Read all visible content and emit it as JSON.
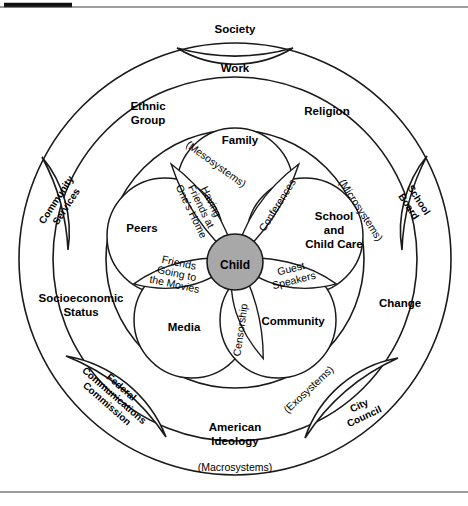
{
  "figure": {
    "center": {
      "label": "Child"
    },
    "levels": {
      "macro_label": "(Macrosystems)",
      "exo_label": "(Exosystems)",
      "meso_label": "(Mesosystems)",
      "micro_label": "(Microsystems)"
    },
    "macrosystem_labels": [
      {
        "id": "society",
        "text": "Society"
      },
      {
        "id": "ethnic-group",
        "text": "Ethnic Group",
        "line1": "Ethnic",
        "line2": "Group"
      },
      {
        "id": "religion",
        "text": "Religion"
      },
      {
        "id": "socioeconomic-status",
        "text": "Socioeconomic Status",
        "line1": "Socioeconomic",
        "line2": "Status"
      },
      {
        "id": "change",
        "text": "Change"
      },
      {
        "id": "american-ideology",
        "text": "American Ideology",
        "line1": "American",
        "line2": "Ideology"
      }
    ],
    "exosystem_lenses": [
      {
        "id": "work",
        "text": "Work"
      },
      {
        "id": "community-services",
        "text": "Community Services",
        "line1": "Community",
        "line2": "Services"
      },
      {
        "id": "school-board",
        "text": "School Board",
        "line1": "School",
        "line2": "Board"
      },
      {
        "id": "federal-communications-commission",
        "text": "Federal Communications Commission",
        "line1": "Federal",
        "line2": "Communications",
        "line3": "Commission"
      },
      {
        "id": "city-council",
        "text": "City Council",
        "line1": "City",
        "line2": "Council"
      }
    ],
    "microsystems": [
      {
        "id": "family",
        "text": "Family"
      },
      {
        "id": "peers",
        "text": "Peers"
      },
      {
        "id": "school-and-child-care",
        "text": "School and Child Care",
        "line1": "School",
        "line2": "and",
        "line3": "Child Care"
      },
      {
        "id": "media",
        "text": "Media"
      },
      {
        "id": "community",
        "text": "Community"
      }
    ],
    "mesosystem_petals": [
      {
        "id": "having-friends-at-ones-home",
        "text": "Having Friends at One's Home",
        "line1": "Having",
        "line2": "Friends at",
        "line3": "One's Home"
      },
      {
        "id": "conferences",
        "text": "Conferences"
      },
      {
        "id": "guest-speakers",
        "text": "Guest Speakers",
        "line1": "Guest",
        "line2": "Speakers"
      },
      {
        "id": "censorship",
        "text": "Censorship"
      },
      {
        "id": "friends-going-to-the-movies",
        "text": "Friends Going to the Movies",
        "line1": "Friends",
        "line2": "Going to",
        "line3": "the Movies"
      }
    ],
    "colors": {
      "stroke": "#1a1a1a",
      "child_fill": "#a8a8a8",
      "background": "#ffffff",
      "rule": "#3a3a3a"
    }
  }
}
